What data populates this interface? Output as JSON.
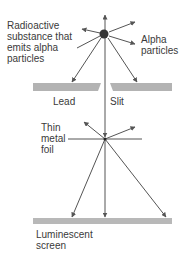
{
  "diagram": {
    "labels": {
      "source": "Radioactive\nsubstance that\nemits alpha\nparticles",
      "alpha": "Alpha\nparticles",
      "lead": "Lead",
      "slit": "Slit",
      "foil": "Thin\nmetal\nfoil",
      "screen": "Luminescent\nscreen"
    },
    "colors": {
      "line": "#555555",
      "plate": "#b3b3b3",
      "screen": "#b8b8b8",
      "source": "#333333",
      "text": "#3a3a3a"
    }
  }
}
